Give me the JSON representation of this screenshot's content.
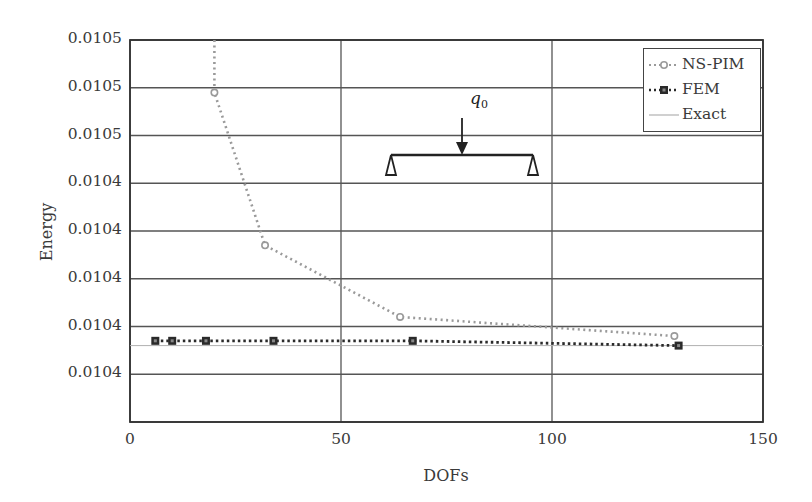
{
  "chart_data": {
    "type": "line",
    "title": "",
    "xlabel": "DOFs",
    "ylabel": "Energy",
    "xlim": [
      0,
      150
    ],
    "ylim": [
      0.010444,
      0.010452
    ],
    "grid": true,
    "legend_position": "upper right",
    "x_ticks": [
      "0",
      "50",
      "100",
      "150"
    ],
    "y_ticks": [
      "0.0105",
      "0.0105",
      "0.0105",
      "0.0104",
      "0.0104",
      "0.0104",
      "0.0104",
      "0.0104"
    ],
    "series": [
      {
        "name": "NS-PIM",
        "style": "dotted gray with circle markers",
        "color": "#9a9a9a",
        "x": [
          20,
          32,
          64,
          129
        ],
        "y": [
          0.0104509,
          0.0104477,
          0.0104462,
          0.0104458
        ]
      },
      {
        "name": "FEM",
        "style": "dotted black with square markers",
        "color": "#2a2a2a",
        "x": [
          6,
          10,
          18,
          34,
          67,
          130
        ],
        "y": [
          0.0104457,
          0.0104457,
          0.0104457,
          0.0104457,
          0.0104457,
          0.0104456
        ]
      },
      {
        "name": "Exact",
        "style": "thin solid gray line",
        "color": "#b0b0b0",
        "x": [
          0,
          150
        ],
        "y": [
          0.0104456,
          0.0104456
        ]
      }
    ],
    "annotations": [
      {
        "type": "inset-diagram",
        "description": "Simply supported beam with point load",
        "label": "q0"
      }
    ]
  },
  "labels": {
    "xlabel": "DOFs",
    "ylabel": "Energy",
    "yticks": [
      "0.0105",
      "0.0105",
      "0.0105",
      "0.0104",
      "0.0104",
      "0.0104",
      "0.0104",
      "0.0104"
    ],
    "xticks": [
      "0",
      "50",
      "100",
      "150"
    ],
    "legend": [
      "NS-PIM",
      "FEM",
      "Exact"
    ],
    "load_symbol": "q",
    "load_subscript": "0"
  }
}
